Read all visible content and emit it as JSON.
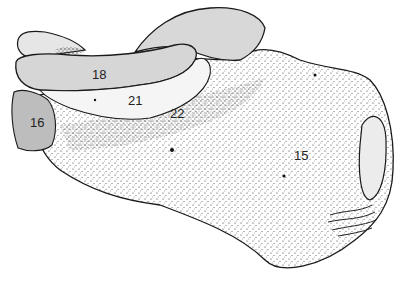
{
  "figure": {
    "labels": [
      {
        "id": "label-18-top",
        "text": "18",
        "x": 92,
        "y": 68
      },
      {
        "id": "label-21",
        "text": "21",
        "x": 128,
        "y": 94
      },
      {
        "id": "label-22",
        "text": "22",
        "x": 170,
        "y": 107
      },
      {
        "id": "label-16",
        "text": "16",
        "x": 30,
        "y": 116
      },
      {
        "id": "label-15",
        "text": "15",
        "x": 294,
        "y": 149
      }
    ],
    "colors": {
      "facet_fill": "#d6d6d6",
      "facet_dark_fill": "#bdbdbd",
      "outline": "#1a1a1a",
      "stipple": "#333333",
      "background": "#ffffff"
    }
  }
}
